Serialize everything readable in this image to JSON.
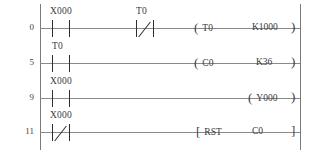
{
  "diagram": {
    "type": "ladder-logic",
    "left_rail": "power-rail-left",
    "right_rail": "power-rail-right",
    "rungs": [
      {
        "step": "0",
        "contacts": [
          {
            "label": "X000",
            "type": "normally-open"
          },
          {
            "label": "T0",
            "type": "normally-closed"
          }
        ],
        "output": {
          "open": "(",
          "name": "T0",
          "operand": "K1000",
          "close": ")",
          "type": "coil"
        }
      },
      {
        "step": "5",
        "contacts": [
          {
            "label": "T0",
            "type": "normally-open"
          }
        ],
        "output": {
          "open": "(",
          "name": "C0",
          "operand": "K36",
          "close": ")",
          "type": "coil"
        }
      },
      {
        "step": "9",
        "contacts": [
          {
            "label": "X000",
            "type": "normally-open"
          }
        ],
        "output": {
          "open": "(",
          "name": "Y000",
          "operand": "",
          "close": ")",
          "type": "coil"
        }
      },
      {
        "step": "11",
        "contacts": [
          {
            "label": "X000",
            "type": "normally-closed"
          }
        ],
        "output": {
          "open": "[",
          "name": "RST",
          "operand": "C0",
          "close": "]",
          "type": "instruction"
        }
      }
    ]
  },
  "colors": {
    "rail": "#7b7b7b",
    "wire": "#8a8a8a",
    "ink": "#3a3a3a",
    "background": "#ffffff"
  }
}
